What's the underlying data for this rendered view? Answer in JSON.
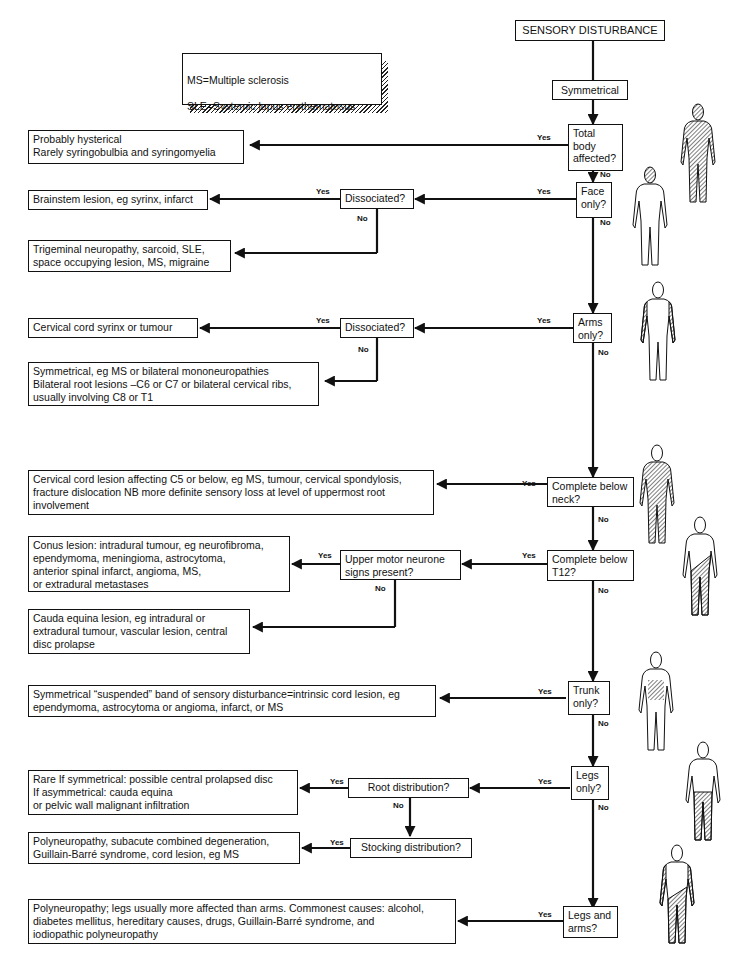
{
  "title": "SENSORY DISTURBANCE",
  "legend": [
    "MS=Multiple sclerosis",
    "SLE=Systemic lupus erythematosus"
  ],
  "branch": "Symmetrical",
  "labels": {
    "yes": "Yes",
    "no": "No"
  },
  "questions": {
    "total_body": "Total\nbody\naffected?",
    "face_only": "Face\nonly?",
    "face_dissociated": "Dissociated?",
    "arms_only": "Arms\nonly?",
    "arms_dissociated": "Dissociated?",
    "below_neck": "Complete below\nneck?",
    "below_t12": "Complete below\nT12?",
    "umn_signs": "Upper motor neurone\nsigns present?",
    "trunk_only": "Trunk\nonly?",
    "legs_only": "Legs\nonly?",
    "root_distribution": "Root distribution?",
    "stocking_distribution": "Stocking distribution?",
    "legs_and_arms": "Legs and\narms?"
  },
  "outcomes": {
    "hysterical": "Probably hysterical\nRarely syringobulbia and syringomyelia",
    "brainstem": "Brainstem lesion, eg syrinx, infarct",
    "trigeminal": "Trigeminal neuropathy, sarcoid, SLE,\nspace occupying lesion, MS, migraine",
    "cervical_syrinx": "Cervical cord  syrinx or tumour",
    "arms_symmetrical": "Symmetrical, eg MS or bilateral mononeuropathies\nBilateral root lesions –C6 or C7  or bilateral cervical ribs,\nusually involving C8 or T1",
    "cervical_cord": "Cervical cord lesion affecting C5 or below, eg MS, tumour, cervical spondylosis,\nfracture dislocation  NB more definite sensory loss at level of uppermost root\ninvolvement",
    "conus": "Conus lesion: intradural tumour, eg neurofibroma,\nependymoma, meningioma,  astrocytoma,\nanterior spinal infarct, angioma, MS,\nor extradural metastases",
    "cauda_equina": "Cauda equina lesion, eg intradural or\nextradural tumour, vascular lesion, central\ndisc prolapse",
    "suspended_band": "Symmetrical “suspended” band of sensory disturbance=intrinsic cord lesion, eg\nependymoma, astrocytoma or angioma, infarct, or MS",
    "rare_disc": "Rare  If symmetrical: possible central prolapsed disc\nIf asymmetrical: cauda equina\nor pelvic wall  malignant infiltration",
    "polyneuropathy_stocking": "Polyneuropathy, subacute combined degeneration,\nGuillain-Barré syndrome, cord  lesion, eg MS",
    "polyneuropathy_general": "Polyneuropathy; legs usually more affected than arms. Commonest causes: alcohol,\ndiabetes mellitus, hereditary causes, drugs, Guillain-Barré syndrome, and\niodiopathic polyneuropathy"
  },
  "figures": [
    {
      "id": "total-body",
      "shading": "full"
    },
    {
      "id": "face",
      "shading": "face"
    },
    {
      "id": "arms",
      "shading": "arms"
    },
    {
      "id": "below-neck",
      "shading": "below-neck"
    },
    {
      "id": "below-t12",
      "shading": "below-t12"
    },
    {
      "id": "trunk",
      "shading": "trunk"
    },
    {
      "id": "legs",
      "shading": "legs"
    },
    {
      "id": "legs-arms",
      "shading": "legs-arms"
    }
  ],
  "colors": {
    "ink": "#111111",
    "paper": "#ffffff"
  }
}
